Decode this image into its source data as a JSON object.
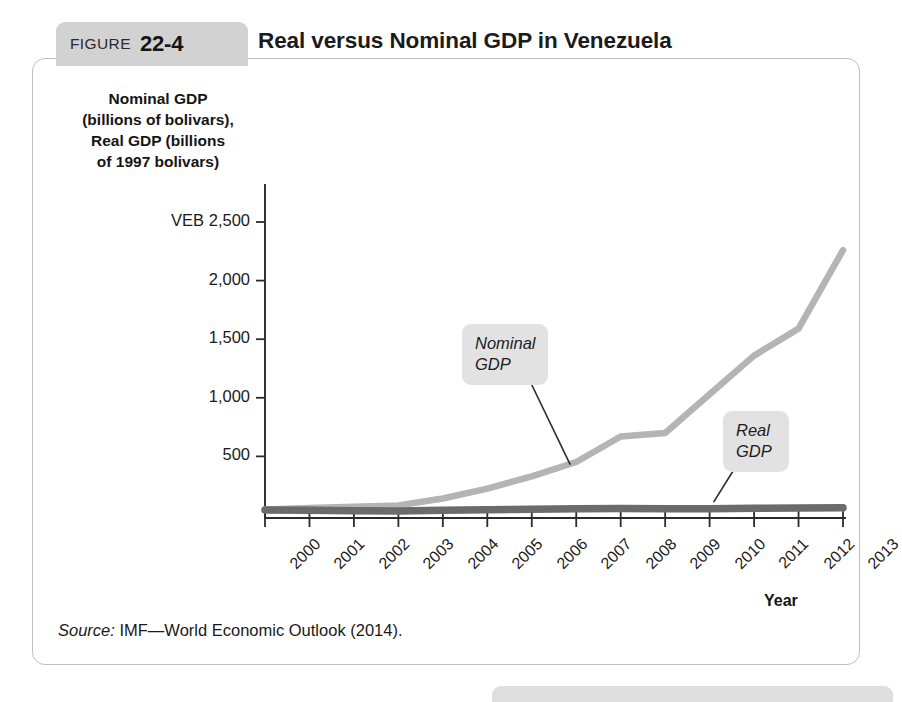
{
  "figure": {
    "label_word": "FIGURE",
    "number": "22-4",
    "title": "Real versus Nominal GDP in Venezuela",
    "source_label": "Source:",
    "source_text": " IMF—World Economic Outlook (2014).",
    "bottom_banner_label": "Quick Review"
  },
  "chart_data": {
    "type": "line",
    "title": "Real versus Nominal GDP in Venezuela",
    "xlabel": "Year",
    "ylabel": "Nominal GDP (billions of bolivars), Real GDP (billions of 1997 bolivars)",
    "ylabel_lines": [
      "Nominal GDP",
      "(billions of bolivars),",
      "Real GDP (billions",
      "of 1997 bolivars)"
    ],
    "x": [
      2000,
      2001,
      2002,
      2003,
      2004,
      2005,
      2006,
      2007,
      2008,
      2009,
      2010,
      2011,
      2012,
      2013
    ],
    "categories": [
      "2000",
      "2001",
      "2002",
      "2003",
      "2004",
      "2005",
      "2006",
      "2007",
      "2008",
      "2009",
      "2010",
      "2011",
      "2012",
      "2013"
    ],
    "ylim": [
      0,
      2500
    ],
    "yticks": [
      0,
      500,
      1000,
      1500,
      2000,
      2500
    ],
    "ytick_labels": [
      "",
      "500",
      "1,000",
      "1,500",
      "2,000",
      "VEB 2,500"
    ],
    "y_unit_prefix": "VEB",
    "grid": false,
    "legend": "callout-labels",
    "series": [
      {
        "name": "Nominal GDP",
        "color": "#b4b4b4",
        "values": [
          48,
          60,
          71,
          82,
          141,
          225,
          329,
          452,
          670,
          700,
          1030,
          1360,
          1590,
          2260
        ]
      },
      {
        "name": "Real GDP",
        "color": "#6b6b6b",
        "values": [
          42,
          41,
          37,
          34,
          40,
          44,
          49,
          53,
          56,
          54,
          54,
          57,
          60,
          61
        ]
      }
    ],
    "annotations": [
      {
        "name": "Nominal GDP",
        "lines": [
          "Nominal",
          "GDP"
        ],
        "points_to_year": 2007,
        "points_to_value": 450
      },
      {
        "name": "Real GDP",
        "lines": [
          "Real",
          "GDP"
        ],
        "points_to_year": 2010,
        "points_to_value": 55
      }
    ]
  }
}
